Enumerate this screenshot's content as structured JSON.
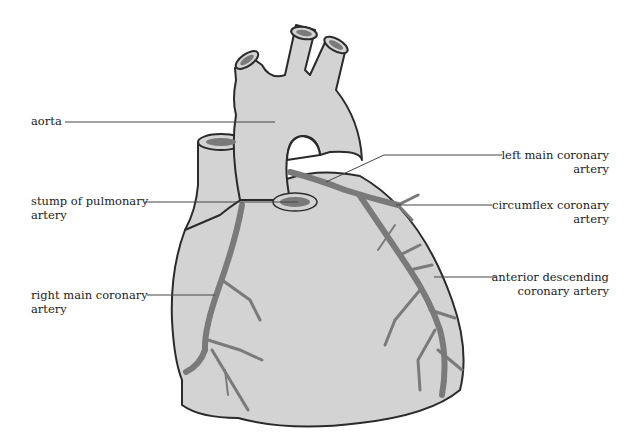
{
  "diagram": {
    "colors": {
      "tissue": "#d3d3d3",
      "outline": "#2a2a2a",
      "artery": "#7a7a7a",
      "leader": "#444444",
      "text": "#222222"
    },
    "labels": {
      "aorta": {
        "line1": "aorta"
      },
      "pulmonary": {
        "line1": "stump of pulmonary",
        "line2": "artery"
      },
      "right_main": {
        "line1": "right main coronary",
        "line2": "artery"
      },
      "left_main": {
        "line1": "left main coronary",
        "line2": "artery"
      },
      "circumflex": {
        "line1": "circumflex coronary",
        "line2": "artery"
      },
      "anterior_desc": {
        "line1": "anterior descending",
        "line2": "coronary artery"
      }
    }
  }
}
